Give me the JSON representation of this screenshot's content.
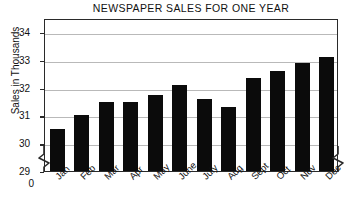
{
  "chart_data": {
    "type": "bar",
    "title": "NEWSPAPER SALES FOR ONE YEAR",
    "xlabel": "",
    "ylabel": "Sales in Thousands",
    "categories": [
      "Jan",
      "Feb",
      "Mar",
      "Apr",
      "May",
      "June",
      "July",
      "Aug",
      "Sept",
      "Oct",
      "Nov",
      "Dec"
    ],
    "values": [
      30.5,
      31.0,
      31.5,
      31.5,
      31.75,
      32.1,
      31.6,
      31.3,
      32.35,
      32.6,
      32.9,
      33.1
    ],
    "ylim": [
      29,
      34.5
    ],
    "yticks": [
      29,
      30,
      31,
      32,
      33,
      34
    ],
    "ytick_labels": [
      "29",
      "30",
      "31",
      "32",
      "33",
      "34"
    ],
    "axis_break_label": "0",
    "axis_break": true,
    "grid": true,
    "legend": false,
    "bar_color": "#0b0b0b",
    "grid_color": "#b9b9b9",
    "frame_color": "#2a2a2a"
  },
  "axis": {
    "break_symbol_left": "axis-break-zigzag",
    "break_symbol_right": "axis-break-zigzag"
  }
}
